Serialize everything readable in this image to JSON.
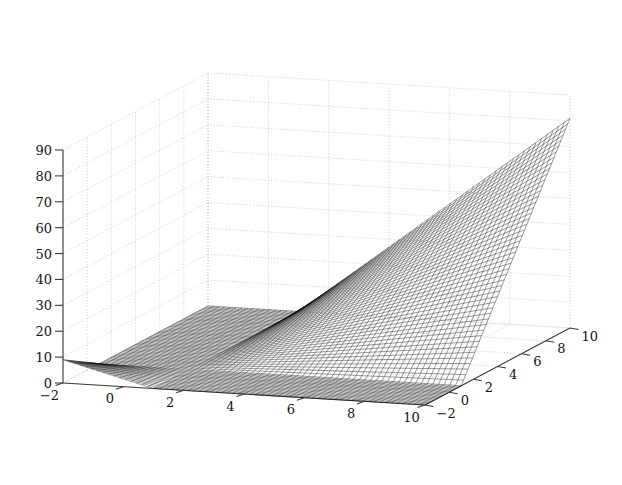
{
  "figure": {
    "width": 622,
    "height": 485,
    "background_color": "#ffffff",
    "style": "matlab-mesh-3d",
    "axis_color": "#3a3a3a",
    "grid_color": "#c8c8c8",
    "mesh_color": "#101010"
  },
  "chart_data": {
    "type": "surface",
    "render": "wireframe-mesh",
    "title": "",
    "subtitle": "",
    "xlabel": "",
    "ylabel": "",
    "zlabel": "",
    "grid": true,
    "legend": null,
    "legend_position": "none",
    "x_ticks": [
      -2,
      0,
      2,
      4,
      6,
      8,
      10
    ],
    "x_tick_labels": [
      "−2",
      "0",
      "2",
      "4",
      "6",
      "8",
      "10"
    ],
    "y_ticks": [
      -2,
      0,
      2,
      4,
      6,
      8,
      10
    ],
    "y_tick_labels": [
      "−2",
      "0",
      "2",
      "4",
      "6",
      "8",
      "10"
    ],
    "z_ticks": [
      0,
      10,
      20,
      30,
      40,
      50,
      60,
      70,
      80,
      90
    ],
    "z_tick_labels": [
      "0",
      "10",
      "20",
      "30",
      "40",
      "50",
      "60",
      "70",
      "80",
      "90"
    ],
    "xlim": [
      -2,
      10
    ],
    "ylim": [
      -2,
      10
    ],
    "zlim": [
      0,
      90
    ],
    "x_axis_position": "bottom-left-front",
    "y_axis_position": "bottom-right-front",
    "z_axis_position": "left-vertical",
    "view": {
      "azimuth_deg": -37.5,
      "elevation_deg": 30,
      "projection": "orthographic"
    },
    "mesh": {
      "nx": 64,
      "ny": 64,
      "x_start": -2,
      "x_end": 10,
      "y_start": -2,
      "y_end": 10,
      "formula": "z = max(0, (x-1)*(y-1))",
      "description": "Flat zero plateau over the low region; steeply rising curved saddle wall toward the back-right corner peaking near z=90",
      "z_min": 0,
      "z_max": 81
    },
    "annotations": [
      {
        "name": "flat-region",
        "text": "",
        "z_value": 0
      },
      {
        "name": "peak-corner",
        "text": "",
        "z_value": 81
      }
    ]
  },
  "screen_geometry": {
    "origin_corner": [
      63,
      383
    ],
    "front_corner": [
      425,
      405
    ],
    "right_corner": [
      570,
      328
    ],
    "back_corner": [
      246,
      305
    ],
    "z_top_left": [
      63,
      150
    ],
    "z_height_px": 233
  }
}
